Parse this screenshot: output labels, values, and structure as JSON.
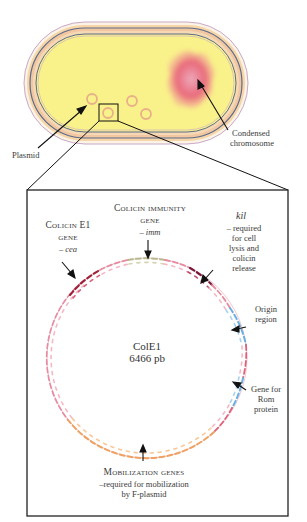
{
  "cell": {
    "labels": {
      "plasmid": "Plasmid",
      "chromosome_line1": "Condensed",
      "chromosome_line2": "chromosome"
    },
    "colors": {
      "cytoplasm": "#f9f18a",
      "chromosome": "#e8697a",
      "membrane_peach": "#f2c6a0",
      "membrane_blue": "#5a6b8c",
      "plasmid_ring": "#e8b088"
    }
  },
  "plasmid_map": {
    "name": "ColE1",
    "size": "6466 pb",
    "genes": [
      {
        "id": "cea",
        "title_line1": "Colicin E1",
        "title_line2": "gene",
        "symbol": "– cea",
        "color": "#a0203a"
      },
      {
        "id": "imm",
        "title_line1": "Colicin immunity",
        "title_line2": "gene",
        "symbol": "– imm",
        "color": "#b8b890"
      },
      {
        "id": "kil",
        "symbol": "kil",
        "desc_lines": [
          "– required",
          "for cell",
          "lysis and",
          "colicin",
          "release"
        ],
        "color": "#7a1a3a"
      },
      {
        "id": "ori",
        "desc_lines": [
          "Origin",
          "region"
        ],
        "color": "#6ab0e0"
      },
      {
        "id": "rom",
        "desc_lines": [
          "Gene for",
          "Rom",
          "protein"
        ],
        "color": "#6ab0e0"
      },
      {
        "id": "mob",
        "title": "Mobilization genes",
        "desc_lines": [
          "–required for mobilization",
          "by F-plasmid"
        ],
        "color": "#f0a060"
      }
    ],
    "backbone_color": "#e88aa0"
  }
}
